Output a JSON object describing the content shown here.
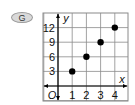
{
  "badge": {
    "label": "G"
  },
  "chart_data": {
    "type": "scatter",
    "title": "",
    "xlabel": "x",
    "ylabel": "y",
    "origin_label": "O",
    "x": [
      1,
      2,
      3,
      4
    ],
    "y": [
      3,
      6,
      9,
      12
    ],
    "x_ticks": [
      "1",
      "2",
      "3",
      "4"
    ],
    "y_ticks": [
      "3",
      "6",
      "9",
      "12"
    ],
    "xlim": [
      -1,
      5
    ],
    "ylim": [
      -1,
      14
    ],
    "grid": true,
    "point_color": "#000000",
    "grid_color": "#8a8a8a"
  }
}
